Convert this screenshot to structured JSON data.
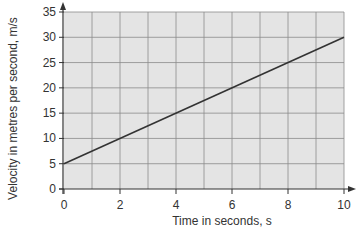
{
  "chart_data": {
    "type": "line",
    "title": "",
    "xlabel": "Time in seconds, s",
    "ylabel": "Velocity in metres per second, m/s",
    "xlim": [
      0,
      10
    ],
    "ylim": [
      0,
      35
    ],
    "x_ticks": [
      0,
      2,
      4,
      6,
      8,
      10
    ],
    "y_ticks": [
      0,
      5,
      10,
      15,
      20,
      25,
      30,
      35
    ],
    "grid": true,
    "legend": null,
    "series": [
      {
        "name": "velocity",
        "x": [
          0,
          10
        ],
        "y": [
          5,
          30
        ]
      }
    ]
  },
  "colors": {
    "plot_background": "#e4e4e4",
    "grid": "#8a8a8a",
    "line": "#333333",
    "axis": "#333333",
    "text": "#333333"
  }
}
